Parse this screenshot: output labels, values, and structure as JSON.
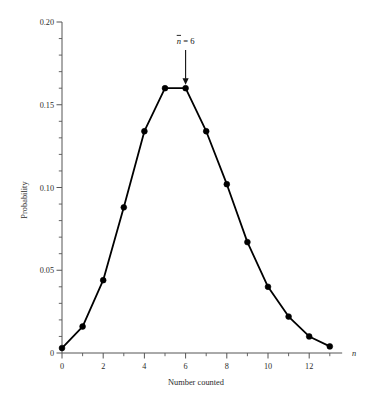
{
  "chart_data": {
    "type": "line",
    "title": "",
    "subtitle": "",
    "xlabel": "Number counted",
    "ylabel": "Probability",
    "x_axis_symbol": "n",
    "xlim": [
      0,
      13.6
    ],
    "ylim": [
      0,
      0.2
    ],
    "grid": false,
    "legend": null,
    "marker": "filled-circle",
    "x": [
      0,
      1,
      2,
      3,
      4,
      5,
      6,
      7,
      8,
      9,
      10,
      11,
      12,
      13
    ],
    "values": [
      0.003,
      0.016,
      0.044,
      0.088,
      0.134,
      0.16,
      0.16,
      0.134,
      0.102,
      0.067,
      0.04,
      0.022,
      0.01,
      0.004
    ],
    "series": [
      {
        "name": "Probability",
        "values": [
          0.003,
          0.016,
          0.044,
          0.088,
          0.134,
          0.16,
          0.16,
          0.134,
          0.102,
          0.067,
          0.04,
          0.022,
          0.01,
          0.004
        ]
      }
    ],
    "x_major_ticks": [
      0,
      2,
      4,
      6,
      8,
      10,
      12
    ],
    "x_major_tick_labels": [
      "0",
      "2",
      "4",
      "6",
      "8",
      "10",
      "12"
    ],
    "x_minor_ticks": [
      1,
      3,
      5,
      7,
      9,
      11,
      13
    ],
    "y_major_ticks": [
      0,
      0.05,
      0.1,
      0.15,
      0.2
    ],
    "y_major_tick_labels": [
      "0",
      "0.05",
      "0.10",
      "0.15",
      "0.20"
    ],
    "y_minor_ticks": [
      0.01,
      0.02,
      0.03,
      0.04,
      0.06,
      0.07,
      0.08,
      0.09,
      0.11,
      0.12,
      0.13,
      0.14,
      0.16,
      0.17,
      0.18,
      0.19
    ],
    "annotations": [
      {
        "text": "n̄ = 6",
        "symbol": "n",
        "overbar": true,
        "equals": "=",
        "value": "6",
        "points_to_x": 6,
        "points_to_y": 0.16,
        "arrow": "down-arrow"
      }
    ],
    "colors": {
      "line": "#000000",
      "marker": "#000000",
      "axis": "#555555",
      "text": "#2b2b2b",
      "background": "#ffffff"
    }
  }
}
